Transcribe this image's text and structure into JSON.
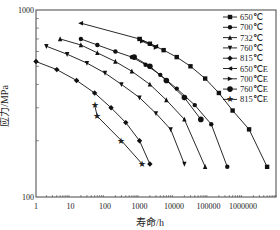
{
  "chart_data": {
    "type": "line",
    "title": "",
    "xlabel": "寿命/h",
    "ylabel": "应力/MPa",
    "xscale": "log",
    "yscale": "log",
    "xlim": [
      1,
      5000000
    ],
    "ylim": [
      100,
      1000
    ],
    "x_ticks": [
      "1",
      "10",
      "100",
      "1000",
      "10000",
      "100000",
      "1000000"
    ],
    "y_ticks": [
      "100",
      "1000"
    ],
    "legend_position": "upper right",
    "series": [
      {
        "name": "650℃",
        "marker": "square",
        "points": [
          [
            1000,
            700
          ],
          [
            2000,
            660
          ],
          [
            5000,
            610
          ],
          [
            12000,
            560
          ],
          [
            30000,
            500
          ],
          [
            80000,
            430
          ],
          [
            200000,
            360
          ],
          [
            500000,
            290
          ],
          [
            1500000,
            230
          ],
          [
            5000000,
            145
          ]
        ]
      },
      {
        "name": "700℃",
        "marker": "circle",
        "points": [
          [
            20,
            700
          ],
          [
            60,
            650
          ],
          [
            200,
            600
          ],
          [
            600,
            560
          ],
          [
            1500,
            510
          ],
          [
            4000,
            450
          ],
          [
            12000,
            380
          ],
          [
            40000,
            310
          ],
          [
            120000,
            245
          ],
          [
            350000,
            145
          ]
        ]
      },
      {
        "name": "732℃",
        "marker": "triangle-up",
        "points": [
          [
            5,
            700
          ],
          [
            20,
            650
          ],
          [
            60,
            590
          ],
          [
            200,
            530
          ],
          [
            600,
            470
          ],
          [
            2000,
            400
          ],
          [
            6000,
            330
          ],
          [
            20000,
            260
          ],
          [
            80000,
            145
          ]
        ]
      },
      {
        "name": "760℃",
        "marker": "triangle-down",
        "points": [
          [
            2,
            640
          ],
          [
            8,
            580
          ],
          [
            30,
            520
          ],
          [
            100,
            460
          ],
          [
            300,
            400
          ],
          [
            1000,
            340
          ],
          [
            3000,
            280
          ],
          [
            8000,
            230
          ],
          [
            20000,
            150
          ]
        ]
      },
      {
        "name": "815℃",
        "marker": "diamond",
        "points": [
          [
            1,
            530
          ],
          [
            4,
            480
          ],
          [
            15,
            420
          ],
          [
            50,
            360
          ],
          [
            150,
            300
          ],
          [
            400,
            250
          ],
          [
            1000,
            200
          ],
          [
            2000,
            150
          ]
        ]
      },
      {
        "name": "650℃E",
        "marker": "triangle-left",
        "points": [
          [
            20,
            850
          ],
          [
            1000,
            700
          ],
          [
            3000,
            640
          ]
        ]
      },
      {
        "name": "700℃E",
        "marker": "triangle-right",
        "points": [
          [
            1200,
            680
          ],
          [
            3000,
            630
          ]
        ]
      },
      {
        "name": "760℃E",
        "marker": "circle-large",
        "points": [
          [
            700,
            560
          ],
          [
            2000,
            500
          ],
          [
            6000,
            420
          ],
          [
            20000,
            340
          ],
          [
            60000,
            260
          ]
        ]
      },
      {
        "name": "815℃E",
        "marker": "star",
        "points": [
          [
            50,
            310
          ],
          [
            60,
            270
          ],
          [
            300,
            200
          ],
          [
            1200,
            150
          ]
        ]
      }
    ]
  }
}
